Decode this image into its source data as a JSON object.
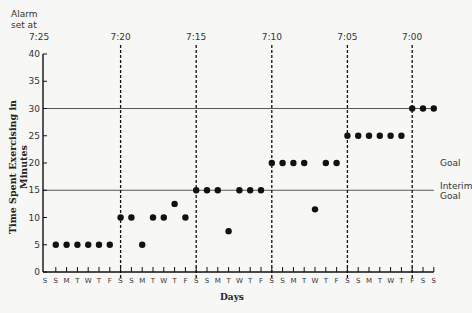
{
  "chart_data": {
    "type": "scatter",
    "title": "",
    "xlabel": "Days",
    "ylabel": "Time Spent Exercising in Minutes",
    "ylim": [
      0,
      40
    ],
    "yticks": [
      0,
      5,
      10,
      15,
      20,
      25,
      30,
      35,
      40
    ],
    "grid": false,
    "x_tick_labels": [
      "S",
      "S",
      "M",
      "T",
      "W",
      "T",
      "F",
      "S",
      "S",
      "M",
      "T",
      "W",
      "T",
      "F",
      "S",
      "S",
      "M",
      "T",
      "W",
      "T",
      "F",
      "S",
      "S",
      "M",
      "T",
      "W",
      "T",
      "F",
      "S",
      "S",
      "M",
      "T",
      "W",
      "T",
      "F",
      "S",
      "S"
    ],
    "phase_header": "Alarm set at",
    "phase_lines": [
      {
        "day_index": 0,
        "label": "7:25",
        "dashed": false
      },
      {
        "day_index": 7,
        "label": "7:20",
        "dashed": true
      },
      {
        "day_index": 14,
        "label": "7:15",
        "dashed": true
      },
      {
        "day_index": 21,
        "label": "7:10",
        "dashed": true
      },
      {
        "day_index": 28,
        "label": "7:05",
        "dashed": true
      },
      {
        "day_index": 34,
        "label": "7:00",
        "dashed": true
      }
    ],
    "reference_lines": [
      {
        "y": 30,
        "label": "Goal"
      },
      {
        "y": 15,
        "label": "Interim Goal"
      }
    ],
    "series": [
      {
        "name": "Minutes exercised",
        "points": [
          {
            "x": 1,
            "y": 5
          },
          {
            "x": 2,
            "y": 5
          },
          {
            "x": 3,
            "y": 5
          },
          {
            "x": 4,
            "y": 5
          },
          {
            "x": 5,
            "y": 5
          },
          {
            "x": 6,
            "y": 5
          },
          {
            "x": 7,
            "y": 10
          },
          {
            "x": 8,
            "y": 10
          },
          {
            "x": 9,
            "y": 5
          },
          {
            "x": 10,
            "y": 10
          },
          {
            "x": 11,
            "y": 10
          },
          {
            "x": 12,
            "y": 12.5
          },
          {
            "x": 13,
            "y": 10
          },
          {
            "x": 14,
            "y": 15
          },
          {
            "x": 15,
            "y": 15
          },
          {
            "x": 16,
            "y": 15
          },
          {
            "x": 17,
            "y": 7.5
          },
          {
            "x": 18,
            "y": 15
          },
          {
            "x": 19,
            "y": 15
          },
          {
            "x": 20,
            "y": 15
          },
          {
            "x": 21,
            "y": 20
          },
          {
            "x": 22,
            "y": 20
          },
          {
            "x": 23,
            "y": 20
          },
          {
            "x": 24,
            "y": 20
          },
          {
            "x": 25,
            "y": 11.5
          },
          {
            "x": 26,
            "y": 20
          },
          {
            "x": 27,
            "y": 20
          },
          {
            "x": 28,
            "y": 25
          },
          {
            "x": 29,
            "y": 25
          },
          {
            "x": 30,
            "y": 25
          },
          {
            "x": 31,
            "y": 25
          },
          {
            "x": 32,
            "y": 25
          },
          {
            "x": 33,
            "y": 25
          },
          {
            "x": 34,
            "y": 30
          },
          {
            "x": 35,
            "y": 30
          },
          {
            "x": 36,
            "y": 30
          }
        ]
      }
    ]
  },
  "labels": {
    "alarm_header_line1": "Alarm",
    "alarm_header_line2": "set at",
    "goal": "Goal",
    "interim_line1": "Interim",
    "interim_line2": "Goal",
    "xlabel": "Days",
    "ylabel": "Time Spent Exercising in Minutes"
  },
  "colors": {
    "ink": "#111111",
    "background": "#f7f7f5"
  }
}
